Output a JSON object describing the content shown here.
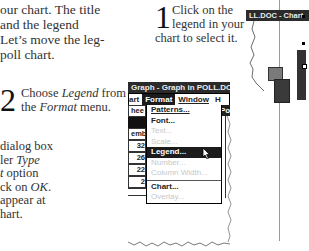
{
  "intro_text": {
    "lines": [
      "our chart. The title",
      " and the legend",
      "Let’s move the leg-",
      "poll chart."
    ]
  },
  "steps": [
    {
      "number": "1",
      "lines": [
        "Click on the",
        "legend in your",
        "chart to select it."
      ]
    },
    {
      "number": "2",
      "lines_html": [
        "Choose ",
        "Legend",
        " from",
        "the ",
        "Format",
        " menu."
      ]
    },
    {
      "number": "3",
      "lines": [
        "dialog box",
        "ler Type",
        "t option",
        "ck on OK.",
        "appear at",
        "hart."
      ]
    }
  ],
  "menu_screenshot": {
    "title": "Graph - Graph in POLL.DOC",
    "menubar": [
      "art",
      "Format",
      "Window",
      "H"
    ],
    "active_menu": "Format",
    "side_labels": [
      "hee",
      "emb",
      "32",
      "26",
      "22",
      "2"
    ],
    "right_tab": "Po",
    "items": [
      {
        "label": "Patterns...",
        "enabled": true
      },
      {
        "label": "Font...",
        "enabled": true
      },
      {
        "label": "Text...",
        "enabled": false
      },
      {
        "label": "Scale...",
        "enabled": false
      },
      {
        "label": "Legend...",
        "enabled": true,
        "selected": true
      },
      {
        "label": "Number...",
        "enabled": false
      },
      {
        "label": "Column Width...",
        "enabled": false
      },
      {
        "label": "Chart...",
        "enabled": true
      },
      {
        "label": "Overlay...",
        "enabled": false
      }
    ]
  },
  "chart_screenshot": {
    "title": "LL.DOC - Chart"
  },
  "colors": {
    "titlebar": "#2b2b2b",
    "selected": "#1c1c1c",
    "disabled": "#c8c8c8",
    "bar_light": "#7a7a7a",
    "bar_dark": "#3a3a3a"
  }
}
